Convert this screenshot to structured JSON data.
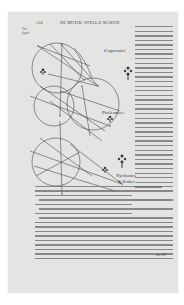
{
  "page": {
    "number": "110",
    "running_head": "DE MOTIB. STELLÆ MARTIS",
    "margin_note": "Vna figura",
    "background_color": "#e4e4e2",
    "ink_color": "#2b2b2b"
  },
  "figure": {
    "labels": {
      "copernicus": "Copernici",
      "ptolemaei": "Ptolemaei",
      "tychonis": "Tychonis",
      "tychonis_sub": "& Braheí"
    },
    "ornaments": [
      "fleuron-1",
      "fleuron-2",
      "fleuron-3",
      "fleuron-4",
      "fleuron-5"
    ]
  },
  "side_column": {
    "line_count": 36
  },
  "body_text": {
    "line_count": 19
  },
  "catchword": "dis. III"
}
